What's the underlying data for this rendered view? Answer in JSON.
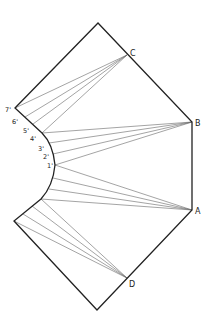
{
  "diagram": {
    "labels": {
      "A": "A",
      "B": "B",
      "C": "C",
      "D": "D",
      "p1": "1'",
      "p2": "2'",
      "p3": "3'",
      "p4": "4'",
      "p5": "5'",
      "p6": "6'",
      "p7": "7'"
    },
    "colors": {
      "outline": "#222222",
      "construction": "#555555",
      "background": "#ffffff"
    }
  }
}
